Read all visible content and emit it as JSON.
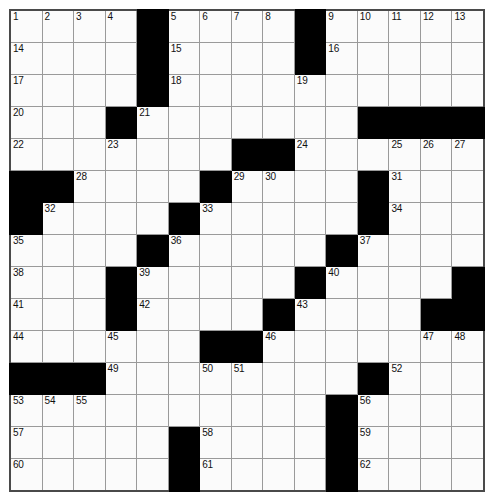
{
  "puzzle": {
    "type": "crossword-grid",
    "rows": 15,
    "columns": 15,
    "cell_size_px": 33,
    "colors": {
      "block_fill": "#000000",
      "cell_fill": "#fbfbfb",
      "grid_line": "#9a9a9a",
      "border": "#4a4a4a",
      "number_text": "#111111"
    },
    "max_clue_number": 62,
    "grid": [
      [
        {
          "block": false,
          "number": "1"
        },
        {
          "block": false,
          "number": "2"
        },
        {
          "block": false,
          "number": "3"
        },
        {
          "block": false,
          "number": "4"
        },
        {
          "block": true,
          "number": ""
        },
        {
          "block": false,
          "number": "5"
        },
        {
          "block": false,
          "number": "6"
        },
        {
          "block": false,
          "number": "7"
        },
        {
          "block": false,
          "number": "8"
        },
        {
          "block": true,
          "number": ""
        },
        {
          "block": false,
          "number": "9"
        },
        {
          "block": false,
          "number": "10"
        },
        {
          "block": false,
          "number": "11"
        },
        {
          "block": false,
          "number": "12"
        },
        {
          "block": false,
          "number": "13"
        }
      ],
      [
        {
          "block": false,
          "number": "14"
        },
        {
          "block": false,
          "number": ""
        },
        {
          "block": false,
          "number": ""
        },
        {
          "block": false,
          "number": ""
        },
        {
          "block": true,
          "number": ""
        },
        {
          "block": false,
          "number": "15"
        },
        {
          "block": false,
          "number": ""
        },
        {
          "block": false,
          "number": ""
        },
        {
          "block": false,
          "number": ""
        },
        {
          "block": true,
          "number": ""
        },
        {
          "block": false,
          "number": "16"
        },
        {
          "block": false,
          "number": ""
        },
        {
          "block": false,
          "number": ""
        },
        {
          "block": false,
          "number": ""
        },
        {
          "block": false,
          "number": ""
        }
      ],
      [
        {
          "block": false,
          "number": "17"
        },
        {
          "block": false,
          "number": ""
        },
        {
          "block": false,
          "number": ""
        },
        {
          "block": false,
          "number": ""
        },
        {
          "block": true,
          "number": ""
        },
        {
          "block": false,
          "number": "18"
        },
        {
          "block": false,
          "number": ""
        },
        {
          "block": false,
          "number": ""
        },
        {
          "block": false,
          "number": ""
        },
        {
          "block": false,
          "number": "19"
        },
        {
          "block": false,
          "number": ""
        },
        {
          "block": false,
          "number": ""
        },
        {
          "block": false,
          "number": ""
        },
        {
          "block": false,
          "number": ""
        },
        {
          "block": false,
          "number": ""
        }
      ],
      [
        {
          "block": false,
          "number": "20"
        },
        {
          "block": false,
          "number": ""
        },
        {
          "block": false,
          "number": ""
        },
        {
          "block": true,
          "number": ""
        },
        {
          "block": false,
          "number": "21"
        },
        {
          "block": false,
          "number": ""
        },
        {
          "block": false,
          "number": ""
        },
        {
          "block": false,
          "number": ""
        },
        {
          "block": false,
          "number": ""
        },
        {
          "block": false,
          "number": ""
        },
        {
          "block": false,
          "number": ""
        },
        {
          "block": true,
          "number": ""
        },
        {
          "block": true,
          "number": ""
        },
        {
          "block": true,
          "number": ""
        },
        {
          "block": true,
          "number": ""
        }
      ],
      [
        {
          "block": false,
          "number": "22"
        },
        {
          "block": false,
          "number": ""
        },
        {
          "block": false,
          "number": ""
        },
        {
          "block": false,
          "number": "23"
        },
        {
          "block": false,
          "number": ""
        },
        {
          "block": false,
          "number": ""
        },
        {
          "block": false,
          "number": ""
        },
        {
          "block": true,
          "number": ""
        },
        {
          "block": true,
          "number": ""
        },
        {
          "block": false,
          "number": "24"
        },
        {
          "block": false,
          "number": ""
        },
        {
          "block": false,
          "number": ""
        },
        {
          "block": false,
          "number": "25"
        },
        {
          "block": false,
          "number": "26"
        },
        {
          "block": false,
          "number": "27"
        }
      ],
      [
        {
          "block": true,
          "number": ""
        },
        {
          "block": true,
          "number": ""
        },
        {
          "block": false,
          "number": "28"
        },
        {
          "block": false,
          "number": ""
        },
        {
          "block": false,
          "number": ""
        },
        {
          "block": false,
          "number": ""
        },
        {
          "block": true,
          "number": ""
        },
        {
          "block": false,
          "number": "29"
        },
        {
          "block": false,
          "number": "30"
        },
        {
          "block": false,
          "number": ""
        },
        {
          "block": false,
          "number": ""
        },
        {
          "block": true,
          "number": ""
        },
        {
          "block": false,
          "number": "31"
        },
        {
          "block": false,
          "number": ""
        },
        {
          "block": false,
          "number": ""
        }
      ],
      [
        {
          "block": true,
          "number": ""
        },
        {
          "block": false,
          "number": "32"
        },
        {
          "block": false,
          "number": ""
        },
        {
          "block": false,
          "number": ""
        },
        {
          "block": false,
          "number": ""
        },
        {
          "block": true,
          "number": ""
        },
        {
          "block": false,
          "number": "33"
        },
        {
          "block": false,
          "number": ""
        },
        {
          "block": false,
          "number": ""
        },
        {
          "block": false,
          "number": ""
        },
        {
          "block": false,
          "number": ""
        },
        {
          "block": true,
          "number": ""
        },
        {
          "block": false,
          "number": "34"
        },
        {
          "block": false,
          "number": ""
        },
        {
          "block": false,
          "number": ""
        }
      ],
      [
        {
          "block": false,
          "number": "35"
        },
        {
          "block": false,
          "number": ""
        },
        {
          "block": false,
          "number": ""
        },
        {
          "block": false,
          "number": ""
        },
        {
          "block": true,
          "number": ""
        },
        {
          "block": false,
          "number": "36"
        },
        {
          "block": false,
          "number": ""
        },
        {
          "block": false,
          "number": ""
        },
        {
          "block": false,
          "number": ""
        },
        {
          "block": false,
          "number": ""
        },
        {
          "block": true,
          "number": ""
        },
        {
          "block": false,
          "number": "37"
        },
        {
          "block": false,
          "number": ""
        },
        {
          "block": false,
          "number": ""
        },
        {
          "block": false,
          "number": ""
        }
      ],
      [
        {
          "block": false,
          "number": "38"
        },
        {
          "block": false,
          "number": ""
        },
        {
          "block": false,
          "number": ""
        },
        {
          "block": true,
          "number": ""
        },
        {
          "block": false,
          "number": "39"
        },
        {
          "block": false,
          "number": ""
        },
        {
          "block": false,
          "number": ""
        },
        {
          "block": false,
          "number": ""
        },
        {
          "block": false,
          "number": ""
        },
        {
          "block": true,
          "number": ""
        },
        {
          "block": false,
          "number": "40"
        },
        {
          "block": false,
          "number": ""
        },
        {
          "block": false,
          "number": ""
        },
        {
          "block": false,
          "number": ""
        },
        {
          "block": true,
          "number": ""
        }
      ],
      [
        {
          "block": false,
          "number": "41"
        },
        {
          "block": false,
          "number": ""
        },
        {
          "block": false,
          "number": ""
        },
        {
          "block": true,
          "number": ""
        },
        {
          "block": false,
          "number": "42"
        },
        {
          "block": false,
          "number": ""
        },
        {
          "block": false,
          "number": ""
        },
        {
          "block": false,
          "number": ""
        },
        {
          "block": true,
          "number": ""
        },
        {
          "block": false,
          "number": "43"
        },
        {
          "block": false,
          "number": ""
        },
        {
          "block": false,
          "number": ""
        },
        {
          "block": false,
          "number": ""
        },
        {
          "block": true,
          "number": ""
        },
        {
          "block": true,
          "number": ""
        }
      ],
      [
        {
          "block": false,
          "number": "44"
        },
        {
          "block": false,
          "number": ""
        },
        {
          "block": false,
          "number": ""
        },
        {
          "block": false,
          "number": "45"
        },
        {
          "block": false,
          "number": ""
        },
        {
          "block": false,
          "number": ""
        },
        {
          "block": true,
          "number": ""
        },
        {
          "block": true,
          "number": ""
        },
        {
          "block": false,
          "number": "46"
        },
        {
          "block": false,
          "number": ""
        },
        {
          "block": false,
          "number": ""
        },
        {
          "block": false,
          "number": ""
        },
        {
          "block": false,
          "number": ""
        },
        {
          "block": false,
          "number": "47"
        },
        {
          "block": false,
          "number": "48"
        }
      ],
      [
        {
          "block": true,
          "number": ""
        },
        {
          "block": true,
          "number": ""
        },
        {
          "block": true,
          "number": ""
        },
        {
          "block": false,
          "number": "49"
        },
        {
          "block": false,
          "number": ""
        },
        {
          "block": false,
          "number": ""
        },
        {
          "block": false,
          "number": "50"
        },
        {
          "block": false,
          "number": "51"
        },
        {
          "block": false,
          "number": ""
        },
        {
          "block": false,
          "number": ""
        },
        {
          "block": false,
          "number": ""
        },
        {
          "block": true,
          "number": ""
        },
        {
          "block": false,
          "number": "52"
        },
        {
          "block": false,
          "number": ""
        },
        {
          "block": false,
          "number": ""
        }
      ],
      [
        {
          "block": false,
          "number": "53"
        },
        {
          "block": false,
          "number": "54"
        },
        {
          "block": false,
          "number": "55"
        },
        {
          "block": false,
          "number": ""
        },
        {
          "block": false,
          "number": ""
        },
        {
          "block": false,
          "number": ""
        },
        {
          "block": false,
          "number": ""
        },
        {
          "block": false,
          "number": ""
        },
        {
          "block": false,
          "number": ""
        },
        {
          "block": false,
          "number": ""
        },
        {
          "block": true,
          "number": ""
        },
        {
          "block": false,
          "number": "56"
        },
        {
          "block": false,
          "number": ""
        },
        {
          "block": false,
          "number": ""
        },
        {
          "block": false,
          "number": ""
        }
      ],
      [
        {
          "block": false,
          "number": "57"
        },
        {
          "block": false,
          "number": ""
        },
        {
          "block": false,
          "number": ""
        },
        {
          "block": false,
          "number": ""
        },
        {
          "block": false,
          "number": ""
        },
        {
          "block": true,
          "number": ""
        },
        {
          "block": false,
          "number": "58"
        },
        {
          "block": false,
          "number": ""
        },
        {
          "block": false,
          "number": ""
        },
        {
          "block": false,
          "number": ""
        },
        {
          "block": true,
          "number": ""
        },
        {
          "block": false,
          "number": "59"
        },
        {
          "block": false,
          "number": ""
        },
        {
          "block": false,
          "number": ""
        },
        {
          "block": false,
          "number": ""
        }
      ],
      [
        {
          "block": false,
          "number": "60"
        },
        {
          "block": false,
          "number": ""
        },
        {
          "block": false,
          "number": ""
        },
        {
          "block": false,
          "number": ""
        },
        {
          "block": false,
          "number": ""
        },
        {
          "block": true,
          "number": ""
        },
        {
          "block": false,
          "number": "61"
        },
        {
          "block": false,
          "number": ""
        },
        {
          "block": false,
          "number": ""
        },
        {
          "block": false,
          "number": ""
        },
        {
          "block": true,
          "number": ""
        },
        {
          "block": false,
          "number": "62"
        },
        {
          "block": false,
          "number": ""
        },
        {
          "block": false,
          "number": ""
        },
        {
          "block": false,
          "number": ""
        }
      ]
    ]
  }
}
